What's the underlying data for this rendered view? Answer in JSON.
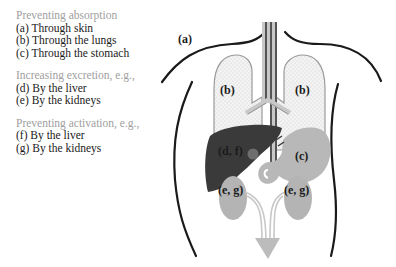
{
  "legend": {
    "groups": [
      {
        "heading": "Preventing absorption",
        "items": [
          "(a) Through skin",
          "(b) Through the lungs",
          "(c) Through the stomach"
        ]
      },
      {
        "heading": "Increasing excretion, e.g.,",
        "items": [
          "(d) By the liver",
          "(e) By the kidneys"
        ]
      },
      {
        "heading": "Preventing activation, e.g.,",
        "items": [
          "(f) By the liver",
          "(g) By the kidneys"
        ]
      }
    ]
  },
  "figure": {
    "labels": {
      "skin": "(a)",
      "lung_left": "(b)",
      "lung_right": "(b)",
      "liver": "(d, f)",
      "stomach": "(c)",
      "kidney_left": "(e, g)",
      "kidney_right": "(e, g)"
    },
    "colors": {
      "outline": "#1a1a1a",
      "lung_fill": "#f0f0f0",
      "lung_stroke": "#9a9a9a",
      "liver": "#3a3a3a",
      "stomach": "#b8b8b8",
      "kidney": "#b4b4b4",
      "arrow": "#bcbcbc",
      "trachea_dark": "#555555",
      "trachea_light": "#c8c8c8"
    }
  }
}
